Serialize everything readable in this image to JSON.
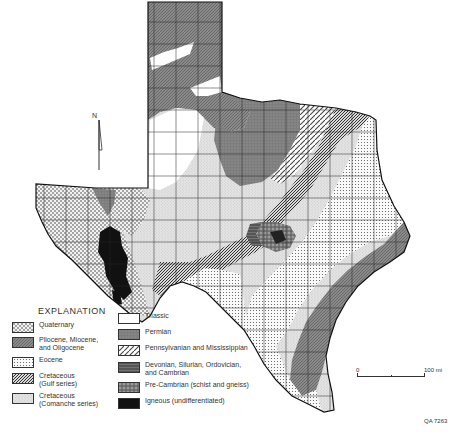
{
  "map": {
    "subject": "Geologic map of Texas",
    "north_arrow_label": "N",
    "scale": {
      "start_label": "0",
      "end_label": "100 mi"
    },
    "figure_id": "QA 7263"
  },
  "legend": {
    "title": "EXPLANATION",
    "items": [
      {
        "label": "Quaternary",
        "pattern": "dots-coarse",
        "color": "#e6e6e6"
      },
      {
        "label": "Pliocene, Miocene,\nand Oligocene",
        "pattern": "dense-gray",
        "color": "#8a8a8a"
      },
      {
        "label": "Eocene",
        "pattern": "grid-dots",
        "color": "#f0f0f0"
      },
      {
        "label": "Cretaceous\n(Gulf series)",
        "pattern": "diagonal-dense",
        "color": "#666666"
      },
      {
        "label": "Cretaceous\n(Comanche series)",
        "pattern": "light-stipple",
        "color": "#d0d0d0"
      },
      {
        "label": "Triassic",
        "pattern": "blank",
        "color": "#ffffff"
      },
      {
        "label": "Permian",
        "pattern": "medium-gray",
        "color": "#7a7a7a"
      },
      {
        "label": "Pennsylvanian and Mississippian",
        "pattern": "diagonal-wide",
        "color": "#bbbbbb"
      },
      {
        "label": "Devonian, Silurian, Ordovician,\nand Cambrian",
        "pattern": "dark-stripe",
        "color": "#555555"
      },
      {
        "label": "Pre-Cambrian (schist and gneiss)",
        "pattern": "mottled",
        "color": "#6e6e6e"
      },
      {
        "label": "Igneous (undifferentiated)",
        "pattern": "solid-black",
        "color": "#111111"
      }
    ]
  }
}
